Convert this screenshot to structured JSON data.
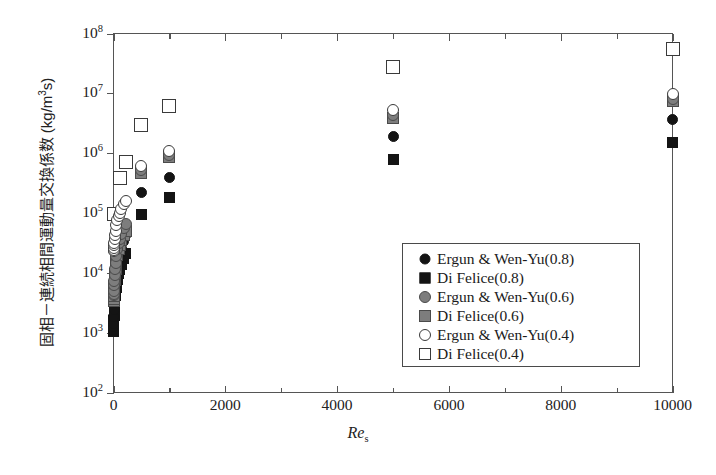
{
  "chart_data": {
    "type": "scatter",
    "title": "",
    "xlabel": "Re_s",
    "ylabel": "固相－連続相間運動量交換係数 (kg/m3s)",
    "ylabel_parts": {
      "text": "固相－連続相間運動量交換係数 (kg/m",
      "sup": "3",
      "tail": "s)"
    },
    "xlabel_parts": {
      "italic": "Re",
      "sub": "s"
    },
    "xscale": "linear",
    "yscale": "log",
    "xlim": [
      0,
      10000
    ],
    "ylim": [
      100,
      100000000
    ],
    "grid": false,
    "legend_position": "lower-right",
    "x_ticks": [
      {
        "value": 0,
        "label": "0"
      },
      {
        "value": 1000,
        "label": "",
        "minor": true
      },
      {
        "value": 2000,
        "label": "2000"
      },
      {
        "value": 3000,
        "label": "",
        "minor": true
      },
      {
        "value": 4000,
        "label": "4000"
      },
      {
        "value": 5000,
        "label": "",
        "minor": true
      },
      {
        "value": 6000,
        "label": "6000"
      },
      {
        "value": 7000,
        "label": "",
        "minor": true
      },
      {
        "value": 8000,
        "label": "8000"
      },
      {
        "value": 9000,
        "label": "",
        "minor": true
      },
      {
        "value": 10000,
        "label": "10000"
      }
    ],
    "y_ticks": [
      {
        "value": 100,
        "mantissa": "10",
        "exponent": "2"
      },
      {
        "value": 1000,
        "mantissa": "10",
        "exponent": "3"
      },
      {
        "value": 10000,
        "mantissa": "10",
        "exponent": "4"
      },
      {
        "value": 100000,
        "mantissa": "10",
        "exponent": "5"
      },
      {
        "value": 1000000,
        "mantissa": "10",
        "exponent": "6"
      },
      {
        "value": 10000000,
        "mantissa": "10",
        "exponent": "7"
      },
      {
        "value": 100000000,
        "mantissa": "10",
        "exponent": "8"
      }
    ],
    "series": [
      {
        "name": "Ergun & Wen-Yu(0.8)",
        "marker": "circle-filled",
        "color": "#141414",
        "size": 11,
        "points": [
          {
            "x": 1,
            "y": 1150
          },
          {
            "x": 2,
            "y": 1250
          },
          {
            "x": 4,
            "y": 1450
          },
          {
            "x": 8,
            "y": 1900
          },
          {
            "x": 12,
            "y": 2400
          },
          {
            "x": 18,
            "y": 3200
          },
          {
            "x": 25,
            "y": 4300
          },
          {
            "x": 35,
            "y": 5800
          },
          {
            "x": 50,
            "y": 8500
          },
          {
            "x": 70,
            "y": 12000
          },
          {
            "x": 90,
            "y": 16000
          },
          {
            "x": 110,
            "y": 20000
          },
          {
            "x": 140,
            "y": 26000
          },
          {
            "x": 180,
            "y": 34000
          },
          {
            "x": 220,
            "y": 42000
          },
          {
            "x": 500,
            "y": 220000
          },
          {
            "x": 1000,
            "y": 400000
          },
          {
            "x": 5000,
            "y": 1900000
          },
          {
            "x": 10000,
            "y": 3600000
          }
        ]
      },
      {
        "name": "Di Felice(0.8)",
        "marker": "square-filled",
        "color": "#141414",
        "size": 11,
        "points": [
          {
            "x": 1,
            "y": 1050
          },
          {
            "x": 2,
            "y": 1120
          },
          {
            "x": 4,
            "y": 1280
          },
          {
            "x": 8,
            "y": 1600
          },
          {
            "x": 12,
            "y": 1950
          },
          {
            "x": 18,
            "y": 2500
          },
          {
            "x": 25,
            "y": 3200
          },
          {
            "x": 35,
            "y": 4200
          },
          {
            "x": 50,
            "y": 5800
          },
          {
            "x": 70,
            "y": 7800
          },
          {
            "x": 90,
            "y": 9800
          },
          {
            "x": 110,
            "y": 11500
          },
          {
            "x": 140,
            "y": 14000
          },
          {
            "x": 180,
            "y": 17500
          },
          {
            "x": 220,
            "y": 21000
          },
          {
            "x": 500,
            "y": 95000
          },
          {
            "x": 1000,
            "y": 180000
          },
          {
            "x": 5000,
            "y": 800000
          },
          {
            "x": 10000,
            "y": 1500000
          }
        ]
      },
      {
        "name": "Ergun & Wen-Yu(0.6)",
        "marker": "circle-gray",
        "color": "#7d7d7d",
        "size": 12,
        "points": [
          {
            "x": 1,
            "y": 4200
          },
          {
            "x": 2,
            "y": 4500
          },
          {
            "x": 4,
            "y": 5000
          },
          {
            "x": 8,
            "y": 6200
          },
          {
            "x": 12,
            "y": 7400
          },
          {
            "x": 18,
            "y": 9200
          },
          {
            "x": 25,
            "y": 11500
          },
          {
            "x": 35,
            "y": 14500
          },
          {
            "x": 50,
            "y": 19000
          },
          {
            "x": 70,
            "y": 25000
          },
          {
            "x": 90,
            "y": 31000
          },
          {
            "x": 110,
            "y": 37000
          },
          {
            "x": 140,
            "y": 45000
          },
          {
            "x": 180,
            "y": 56000
          },
          {
            "x": 220,
            "y": 66000
          },
          {
            "x": 500,
            "y": 520000
          },
          {
            "x": 1000,
            "y": 950000
          },
          {
            "x": 5000,
            "y": 4300000
          },
          {
            "x": 10000,
            "y": 8200000
          }
        ]
      },
      {
        "name": "Di Felice(0.6)",
        "marker": "square-gray",
        "color": "#7d7d7d",
        "size": 12,
        "points": [
          {
            "x": 1,
            "y": 3400
          },
          {
            "x": 2,
            "y": 3650
          },
          {
            "x": 4,
            "y": 4100
          },
          {
            "x": 8,
            "y": 5100
          },
          {
            "x": 12,
            "y": 6100
          },
          {
            "x": 18,
            "y": 7600
          },
          {
            "x": 25,
            "y": 9400
          },
          {
            "x": 35,
            "y": 11800
          },
          {
            "x": 50,
            "y": 15500
          },
          {
            "x": 70,
            "y": 20000
          },
          {
            "x": 90,
            "y": 25000
          },
          {
            "x": 110,
            "y": 29000
          },
          {
            "x": 140,
            "y": 35000
          },
          {
            "x": 180,
            "y": 43000
          },
          {
            "x": 220,
            "y": 51000
          },
          {
            "x": 500,
            "y": 470000
          },
          {
            "x": 1000,
            "y": 880000
          },
          {
            "x": 5000,
            "y": 3900000
          },
          {
            "x": 10000,
            "y": 7400000
          }
        ]
      },
      {
        "name": "Ergun & Wen-Yu(0.4)",
        "marker": "circle-open",
        "color": "#ffffff",
        "size": 12,
        "points": [
          {
            "x": 1,
            "y": 23000
          },
          {
            "x": 2,
            "y": 24000
          },
          {
            "x": 4,
            "y": 26000
          },
          {
            "x": 8,
            "y": 29000
          },
          {
            "x": 12,
            "y": 32000
          },
          {
            "x": 18,
            "y": 37000
          },
          {
            "x": 25,
            "y": 43000
          },
          {
            "x": 35,
            "y": 51000
          },
          {
            "x": 50,
            "y": 62000
          },
          {
            "x": 70,
            "y": 76000
          },
          {
            "x": 90,
            "y": 89000
          },
          {
            "x": 110,
            "y": 100000
          },
          {
            "x": 140,
            "y": 118000
          },
          {
            "x": 180,
            "y": 140000
          },
          {
            "x": 220,
            "y": 160000
          },
          {
            "x": 500,
            "y": 620000
          },
          {
            "x": 1000,
            "y": 1100000
          },
          {
            "x": 5000,
            "y": 5200000
          },
          {
            "x": 10000,
            "y": 9800000
          }
        ]
      },
      {
        "name": "Di Felice(0.4)",
        "marker": "square-open",
        "color": "#ffffff",
        "size": 14,
        "points": [
          {
            "x": 1,
            "y": 95000
          },
          {
            "x": 110,
            "y": 390000
          },
          {
            "x": 220,
            "y": 700000
          },
          {
            "x": 500,
            "y": 3000000
          },
          {
            "x": 1000,
            "y": 6200000
          },
          {
            "x": 5000,
            "y": 28000000
          },
          {
            "x": 10000,
            "y": 55000000
          }
        ]
      }
    ],
    "legend_entries": [
      {
        "label": "Ergun & Wen-Yu(0.8)",
        "marker": "circle-filled"
      },
      {
        "label": "Di Felice(0.8)",
        "marker": "square-filled"
      },
      {
        "label": "Ergun & Wen-Yu(0.6)",
        "marker": "circle-gray"
      },
      {
        "label": "Di Felice(0.6)",
        "marker": "square-gray"
      },
      {
        "label": "Ergun & Wen-Yu(0.4)",
        "marker": "circle-open"
      },
      {
        "label": "Di Felice(0.4)",
        "marker": "square-open"
      }
    ]
  },
  "colors": {
    "axis": "#555555",
    "text": "#222222",
    "filled": "#141414",
    "gray": "#7d7d7d",
    "gray_edge": "#4a4a4a",
    "open_edge": "#3a3a3a",
    "background": "#ffffff"
  }
}
